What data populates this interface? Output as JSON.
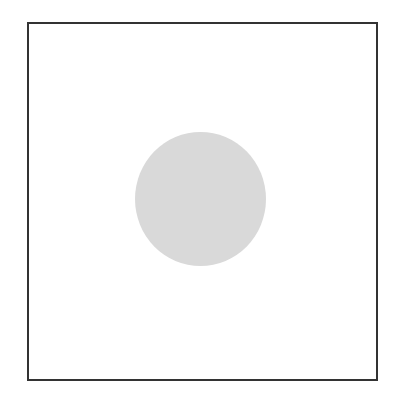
{
  "figure": {
    "frame": {
      "border_color": "#333333",
      "background": "#ffffff"
    },
    "circle": {
      "fill": "#d9d9d9",
      "shape": "circle"
    }
  }
}
